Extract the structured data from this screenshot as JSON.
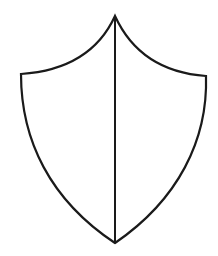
{
  "figure": {
    "subject": "shield outline divided vertically",
    "stroke_color": "#1a1a1a",
    "background_color": "#ffffff",
    "stroke_width": 2.2,
    "shape": {
      "apex": [
        115,
        16
      ],
      "left_shoulder": [
        21,
        74
      ],
      "right_shoulder": [
        206,
        76
      ],
      "bottom_point": [
        115,
        243
      ]
    },
    "divider": {
      "from": [
        115,
        16
      ],
      "to": [
        115,
        243
      ]
    }
  }
}
